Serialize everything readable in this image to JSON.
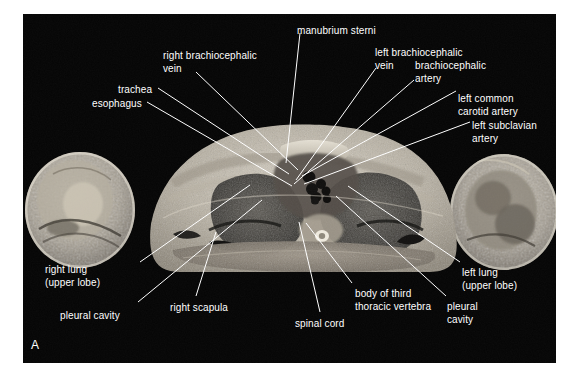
{
  "figure": {
    "kind": "anatomical-cross-section-photograph",
    "plate_letter": "A",
    "background_color": "#ffffff",
    "plate_background_color": "#050505",
    "label_color": "#ffffff",
    "leader_line_color": "#ffffff"
  },
  "labels": [
    {
      "id": "manubrium-sterni",
      "lines": [
        "manubrium sterni"
      ],
      "x": 297,
      "y": 25,
      "align": "left"
    },
    {
      "id": "right-brachiocephalic-vein",
      "lines": [
        "right brachiocephalic",
        "vein"
      ],
      "x": 163,
      "y": 50,
      "align": "left"
    },
    {
      "id": "left-brachiocephalic-vein",
      "lines": [
        "left brachiocephalic",
        "vein"
      ],
      "x": 375,
      "y": 47,
      "align": "left"
    },
    {
      "id": "brachiocephalic-artery",
      "lines": [
        "brachiocephalic",
        "artery"
      ],
      "x": 415,
      "y": 60,
      "align": "left"
    },
    {
      "id": "left-common-carotid-artery",
      "lines": [
        "left common",
        "carotid artery"
      ],
      "x": 458,
      "y": 93,
      "align": "left"
    },
    {
      "id": "left-subclavian-artery",
      "lines": [
        "left subclavian",
        "artery"
      ],
      "x": 472,
      "y": 120,
      "align": "left"
    },
    {
      "id": "trachea",
      "lines": [
        "trachea"
      ],
      "x": 118,
      "y": 84,
      "align": "left"
    },
    {
      "id": "esophagus",
      "lines": [
        "esophagus"
      ],
      "x": 92,
      "y": 98,
      "align": "left"
    },
    {
      "id": "right-lung-upper-lobe",
      "lines": [
        "right lung",
        "(upper lobe)"
      ],
      "x": 45,
      "y": 264,
      "align": "left"
    },
    {
      "id": "pleural-cavity-right",
      "lines": [
        "pleural cavity"
      ],
      "x": 60,
      "y": 310,
      "align": "left"
    },
    {
      "id": "right-scapula",
      "lines": [
        "right scapula"
      ],
      "x": 170,
      "y": 302,
      "align": "left"
    },
    {
      "id": "spinal-cord",
      "lines": [
        "spinal cord"
      ],
      "x": 295,
      "y": 318,
      "align": "left"
    },
    {
      "id": "body-of-third-thoracic-vertebra",
      "lines": [
        "body of third",
        "thoracic vertebra"
      ],
      "x": 355,
      "y": 288,
      "align": "left"
    },
    {
      "id": "pleural-cavity-left",
      "lines": [
        "pleural",
        "cavity"
      ],
      "x": 447,
      "y": 301,
      "align": "left"
    },
    {
      "id": "left-lung-upper-lobe",
      "lines": [
        "left lung",
        "(upper lobe)"
      ],
      "x": 462,
      "y": 267,
      "align": "left"
    }
  ],
  "leader_lines": [
    {
      "id": "leader-manubrium-sterni",
      "x1": 300,
      "y1": 33,
      "x2": 286,
      "y2": 163
    },
    {
      "id": "leader-right-brachiocephalic-vein",
      "x1": 196,
      "y1": 72,
      "x2": 298,
      "y2": 170
    },
    {
      "id": "leader-left-brachiocephalic-vein",
      "x1": 376,
      "y1": 68,
      "x2": 296,
      "y2": 180
    },
    {
      "id": "leader-brachiocephalic-artery",
      "x1": 414,
      "y1": 80,
      "x2": 294,
      "y2": 184
    },
    {
      "id": "leader-left-common-carotid-artery",
      "x1": 456,
      "y1": 91,
      "x2": 302,
      "y2": 176
    },
    {
      "id": "leader-left-subclavian-artery",
      "x1": 470,
      "y1": 122,
      "x2": 304,
      "y2": 184
    },
    {
      "id": "leader-trachea",
      "x1": 158,
      "y1": 88,
      "x2": 289,
      "y2": 174
    },
    {
      "id": "leader-esophagus",
      "x1": 147,
      "y1": 102,
      "x2": 292,
      "y2": 186
    },
    {
      "id": "leader-right-lung",
      "x1": 140,
      "y1": 262,
      "x2": 250,
      "y2": 185
    },
    {
      "id": "leader-pleural-cavity-right",
      "x1": 138,
      "y1": 302,
      "x2": 262,
      "y2": 200
    },
    {
      "id": "leader-right-scapula",
      "x1": 196,
      "y1": 296,
      "x2": 216,
      "y2": 232
    },
    {
      "id": "leader-spinal-cord",
      "x1": 320,
      "y1": 312,
      "x2": 299,
      "y2": 222
    },
    {
      "id": "leader-body-of-third-vertebra",
      "x1": 352,
      "y1": 283,
      "x2": 306,
      "y2": 223
    },
    {
      "id": "leader-pleural-cavity-left",
      "x1": 446,
      "y1": 296,
      "x2": 336,
      "y2": 196
    },
    {
      "id": "leader-left-lung",
      "x1": 460,
      "y1": 262,
      "x2": 348,
      "y2": 186
    }
  ],
  "anatomy_regions": [
    {
      "id": "right-arm",
      "side": "viewer-left",
      "note": "upper arm cross-section, fatty marrow and muscle"
    },
    {
      "id": "left-arm",
      "side": "viewer-right",
      "note": "upper arm cross-section, fatty marrow and muscle"
    },
    {
      "id": "thorax-body",
      "side": "center",
      "note": "thoracic wall, mediastinum and lungs"
    },
    {
      "id": "right-lung",
      "side": "viewer-left",
      "note": "dark aerated lung field"
    },
    {
      "id": "left-lung",
      "side": "viewer-right",
      "note": "dark aerated lung field"
    },
    {
      "id": "mediastinum",
      "side": "center",
      "note": "great vessels, trachea and esophagus"
    },
    {
      "id": "vertebral-body",
      "side": "center",
      "note": "third thoracic vertebra with spinal canal"
    }
  ]
}
